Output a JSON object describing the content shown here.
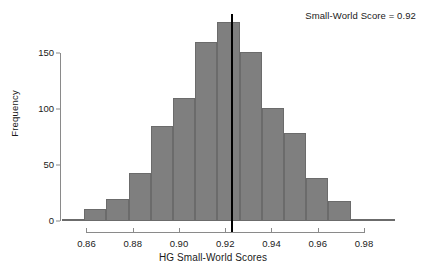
{
  "chart_data": {
    "type": "bar",
    "title": "",
    "xlabel": "HG Small-World Scores",
    "ylabel": "Frequency",
    "grid": false,
    "legend": "none",
    "xlim": [
      0.849,
      0.993
    ],
    "ylim": [
      0,
      185
    ],
    "bin_width": 0.0096,
    "x_ticks": [
      "0.86",
      "0.88",
      "0.90",
      "0.92",
      "0.94",
      "0.96",
      "0.98"
    ],
    "x_tick_values": [
      0.86,
      0.88,
      0.9,
      0.92,
      0.94,
      0.96,
      0.98
    ],
    "y_ticks": [
      "0",
      "50",
      "100",
      "150"
    ],
    "y_tick_values": [
      0,
      50,
      100,
      150
    ],
    "categories": [
      "0.849-0.859",
      "0.859-0.868",
      "0.868-0.878",
      "0.878-0.887",
      "0.887-0.897",
      "0.897-0.907",
      "0.907-0.916",
      "0.916-0.926",
      "0.926-0.935",
      "0.935-0.945",
      "0.945-0.955",
      "0.955-0.964",
      "0.964-0.974",
      "0.974-0.983",
      "0.983-0.993"
    ],
    "bin_starts": [
      0.8494,
      0.859,
      0.8686,
      0.8782,
      0.8878,
      0.8974,
      0.907,
      0.9166,
      0.9262,
      0.9358,
      0.9454,
      0.955,
      0.9646,
      0.9742,
      0.9838
    ],
    "values": [
      2,
      11,
      20,
      43,
      85,
      110,
      160,
      178,
      151,
      101,
      79,
      38,
      18,
      2,
      1
    ],
    "annotations": [
      {
        "text": "Small-World Score = 0.92",
        "position": "top-right"
      }
    ],
    "reference_line": {
      "label": "small-world-score",
      "value": 0.9229,
      "color": "#000000",
      "orientation": "vertical"
    },
    "bar_color": "#7f7f7f",
    "bar_border_color": "#6b6b6b",
    "axis_color": "#8a8a8a"
  },
  "annotation": {
    "text": "Small-World Score = 0.92"
  },
  "axes": {
    "x_label": "HG Small-World Scores",
    "y_label": "Frequency"
  }
}
